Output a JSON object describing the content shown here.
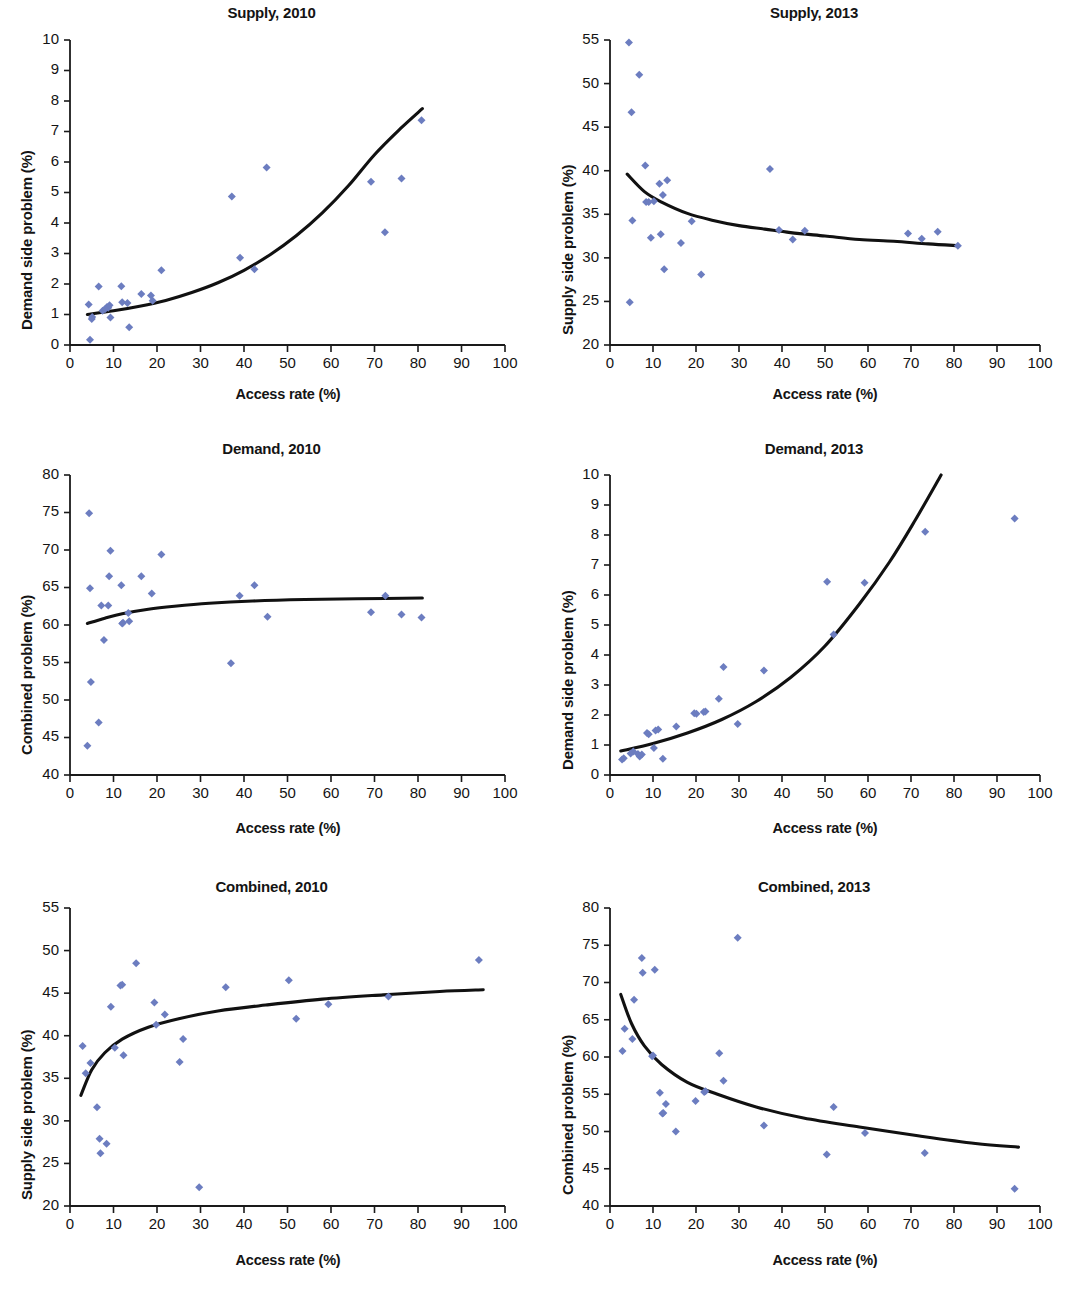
{
  "figure": {
    "panel_count": 6,
    "marker_color": "#6c7dc0",
    "curve_color": "#111111",
    "axis_color": "#1a1a1a"
  },
  "panels": [
    {
      "id": "supply-2010",
      "title": "Supply, 2010",
      "xlabel": "Access rate (%)",
      "ylabel": "Demand side problem (%)",
      "xlim": [
        0,
        100
      ],
      "ylim": [
        0,
        10
      ],
      "xticks": [
        0,
        10,
        20,
        30,
        40,
        50,
        60,
        70,
        80,
        90,
        100
      ],
      "yticks": [
        0,
        1,
        2,
        3,
        4,
        5,
        6,
        7,
        8,
        9,
        10
      ]
    },
    {
      "id": "supply-2013",
      "title": "Supply, 2013",
      "xlabel": "Access rate (%)",
      "ylabel": "Supply side problem (%)",
      "xlim": [
        0,
        100
      ],
      "ylim": [
        20,
        55
      ],
      "xticks": [
        0,
        10,
        20,
        30,
        40,
        50,
        60,
        70,
        80,
        90,
        100
      ],
      "yticks": [
        20,
        25,
        30,
        35,
        40,
        45,
        50,
        55
      ]
    },
    {
      "id": "demand-2010",
      "title": "Demand, 2010",
      "xlabel": "Access rate (%)",
      "ylabel": "Combined problem (%)",
      "xlim": [
        0,
        100
      ],
      "ylim": [
        40,
        80
      ],
      "xticks": [
        0,
        10,
        20,
        30,
        40,
        50,
        60,
        70,
        80,
        90,
        100
      ],
      "yticks": [
        40,
        45,
        50,
        55,
        60,
        65,
        70,
        75,
        80
      ]
    },
    {
      "id": "demand-2013",
      "title": "Demand, 2013",
      "xlabel": "Access rate (%)",
      "ylabel": "Demand side problem (%)",
      "xlim": [
        0,
        100
      ],
      "ylim": [
        0,
        10
      ],
      "xticks": [
        0,
        10,
        20,
        30,
        40,
        50,
        60,
        70,
        80,
        90,
        100
      ],
      "yticks": [
        0,
        1,
        2,
        3,
        4,
        5,
        6,
        7,
        8,
        9,
        10
      ]
    },
    {
      "id": "combined-2010",
      "title": "Combined, 2010",
      "xlabel": "Access rate (%)",
      "ylabel": "Supply side problem (%)",
      "xlim": [
        0,
        100
      ],
      "ylim": [
        20,
        55
      ],
      "xticks": [
        0,
        10,
        20,
        30,
        40,
        50,
        60,
        70,
        80,
        90,
        100
      ],
      "yticks": [
        20,
        25,
        30,
        35,
        40,
        45,
        50,
        55
      ]
    },
    {
      "id": "combined-2013",
      "title": "Combined, 2013",
      "xlabel": "Access rate (%)",
      "ylabel": "Combined problem (%)",
      "xlim": [
        0,
        100
      ],
      "ylim": [
        40,
        80
      ],
      "xticks": [
        0,
        10,
        20,
        30,
        40,
        50,
        60,
        70,
        80,
        90,
        100
      ],
      "yticks": [
        40,
        45,
        50,
        55,
        60,
        65,
        70,
        75,
        80
      ]
    }
  ],
  "chart_data": [
    {
      "type": "scatter",
      "title": "Supply, 2010",
      "xlabel": "Access rate (%)",
      "ylabel": "Demand side problem (%)",
      "xlim": [
        0,
        100
      ],
      "ylim": [
        0,
        10
      ],
      "grid": false,
      "legend": "none",
      "points": [
        [
          4.3,
          1.33
        ],
        [
          4.6,
          0.17
        ],
        [
          5.0,
          0.85
        ],
        [
          5.1,
          0.92
        ],
        [
          6.6,
          1.92
        ],
        [
          7.5,
          1.12
        ],
        [
          8.1,
          1.18
        ],
        [
          8.5,
          1.25
        ],
        [
          8.8,
          1.22
        ],
        [
          9.1,
          1.3
        ],
        [
          9.3,
          0.9
        ],
        [
          11.8,
          1.93
        ],
        [
          12.0,
          1.4
        ],
        [
          13.2,
          1.38
        ],
        [
          13.6,
          0.58
        ],
        [
          16.4,
          1.67
        ],
        [
          18.6,
          1.62
        ],
        [
          19.0,
          1.45
        ],
        [
          21.0,
          2.45
        ],
        [
          37.2,
          4.87
        ],
        [
          39.1,
          2.86
        ],
        [
          42.4,
          2.48
        ],
        [
          45.2,
          5.82
        ],
        [
          69.2,
          5.35
        ],
        [
          72.4,
          3.7
        ],
        [
          76.2,
          5.46
        ],
        [
          80.8,
          7.37
        ]
      ],
      "fit_curve": {
        "kind": "exponential",
        "x_range": [
          4.0,
          81.0
        ],
        "xy": [
          [
            4,
            1.0
          ],
          [
            10,
            1.12
          ],
          [
            16,
            1.27
          ],
          [
            22,
            1.46
          ],
          [
            28,
            1.72
          ],
          [
            34,
            2.04
          ],
          [
            40,
            2.45
          ],
          [
            46,
            2.96
          ],
          [
            52,
            3.58
          ],
          [
            58,
            4.33
          ],
          [
            64,
            5.22
          ],
          [
            70,
            6.24
          ],
          [
            76,
            7.1
          ],
          [
            81,
            7.75
          ]
        ]
      }
    },
    {
      "type": "scatter",
      "title": "Supply, 2013",
      "xlabel": "Access rate (%)",
      "ylabel": "Supply side problem (%)",
      "xlim": [
        0,
        100
      ],
      "ylim": [
        20,
        55
      ],
      "grid": false,
      "legend": "none",
      "points": [
        [
          4.4,
          54.7
        ],
        [
          4.6,
          24.9
        ],
        [
          5.0,
          46.7
        ],
        [
          5.2,
          34.3
        ],
        [
          6.8,
          51.0
        ],
        [
          8.2,
          40.6
        ],
        [
          8.4,
          36.4
        ],
        [
          9.0,
          36.4
        ],
        [
          9.5,
          32.3
        ],
        [
          10.2,
          36.5
        ],
        [
          11.5,
          38.5
        ],
        [
          11.8,
          32.7
        ],
        [
          12.3,
          37.2
        ],
        [
          12.6,
          28.7
        ],
        [
          13.3,
          38.9
        ],
        [
          16.5,
          31.7
        ],
        [
          19.0,
          34.2
        ],
        [
          21.2,
          28.1
        ],
        [
          37.2,
          40.2
        ],
        [
          39.3,
          33.2
        ],
        [
          42.5,
          32.1
        ],
        [
          45.3,
          33.1
        ],
        [
          69.3,
          32.8
        ],
        [
          72.5,
          32.2
        ],
        [
          76.2,
          33.0
        ],
        [
          80.9,
          31.4
        ]
      ],
      "fit_curve": {
        "kind": "power-decay",
        "x_range": [
          4.0,
          81.0
        ],
        "xy": [
          [
            4,
            39.6
          ],
          [
            8,
            37.6
          ],
          [
            12,
            36.4
          ],
          [
            18,
            35.1
          ],
          [
            24,
            34.3
          ],
          [
            30,
            33.7
          ],
          [
            36,
            33.3
          ],
          [
            42,
            32.9
          ],
          [
            50,
            32.5
          ],
          [
            58,
            32.1
          ],
          [
            66,
            31.9
          ],
          [
            74,
            31.6
          ],
          [
            81,
            31.4
          ]
        ]
      }
    },
    {
      "type": "scatter",
      "title": "Demand, 2010",
      "xlabel": "Access rate (%)",
      "ylabel": "Combined problem (%)",
      "xlim": [
        0,
        100
      ],
      "ylim": [
        40,
        80
      ],
      "grid": false,
      "legend": "none",
      "points": [
        [
          4.0,
          43.9
        ],
        [
          4.4,
          74.9
        ],
        [
          4.6,
          64.9
        ],
        [
          4.8,
          52.4
        ],
        [
          6.6,
          47.0
        ],
        [
          7.2,
          62.6
        ],
        [
          7.8,
          58.0
        ],
        [
          8.8,
          62.6
        ],
        [
          9.0,
          66.5
        ],
        [
          9.3,
          69.9
        ],
        [
          11.8,
          65.3
        ],
        [
          12.0,
          60.2
        ],
        [
          12.2,
          60.3
        ],
        [
          13.4,
          61.6
        ],
        [
          13.6,
          60.5
        ],
        [
          16.4,
          66.5
        ],
        [
          18.8,
          64.2
        ],
        [
          21.0,
          69.4
        ],
        [
          37.0,
          54.9
        ],
        [
          39.0,
          63.9
        ],
        [
          42.4,
          65.3
        ],
        [
          45.4,
          61.1
        ],
        [
          69.2,
          61.7
        ],
        [
          72.5,
          63.9
        ],
        [
          76.2,
          61.4
        ],
        [
          80.8,
          61.0
        ]
      ],
      "fit_curve": {
        "kind": "log-flat",
        "x_range": [
          4.0,
          81.0
        ],
        "xy": [
          [
            4,
            60.2
          ],
          [
            8,
            60.9
          ],
          [
            12,
            61.5
          ],
          [
            18,
            62.1
          ],
          [
            24,
            62.5
          ],
          [
            32,
            62.9
          ],
          [
            42,
            63.2
          ],
          [
            54,
            63.4
          ],
          [
            66,
            63.5
          ],
          [
            81,
            63.6
          ]
        ]
      }
    },
    {
      "type": "scatter",
      "title": "Demand, 2013",
      "xlabel": "Access rate (%)",
      "ylabel": "Demand side problem (%)",
      "xlim": [
        0,
        100
      ],
      "ylim": [
        0,
        10
      ],
      "grid": false,
      "legend": "none",
      "points": [
        [
          2.8,
          0.52
        ],
        [
          3.2,
          0.56
        ],
        [
          4.8,
          0.72
        ],
        [
          5.4,
          0.78
        ],
        [
          6.5,
          0.7
        ],
        [
          6.9,
          0.62
        ],
        [
          7.4,
          0.68
        ],
        [
          8.6,
          1.4
        ],
        [
          9.0,
          1.36
        ],
        [
          10.2,
          0.9
        ],
        [
          10.6,
          1.48
        ],
        [
          11.2,
          1.52
        ],
        [
          12.3,
          0.54
        ],
        [
          15.4,
          1.62
        ],
        [
          19.6,
          2.06
        ],
        [
          20.1,
          2.04
        ],
        [
          21.8,
          2.1
        ],
        [
          22.2,
          2.12
        ],
        [
          25.3,
          2.54
        ],
        [
          26.4,
          3.6
        ],
        [
          29.7,
          1.7
        ],
        [
          35.8,
          3.48
        ],
        [
          50.5,
          6.44
        ],
        [
          52.0,
          4.68
        ],
        [
          59.2,
          6.41
        ],
        [
          73.3,
          8.11
        ],
        [
          94.1,
          8.55
        ]
      ],
      "fit_curve": {
        "kind": "exponential",
        "x_range": [
          2.5,
          77.0
        ],
        "xy": [
          [
            2.5,
            0.8
          ],
          [
            10,
            1.05
          ],
          [
            18,
            1.4
          ],
          [
            26,
            1.85
          ],
          [
            34,
            2.45
          ],
          [
            42,
            3.25
          ],
          [
            50,
            4.3
          ],
          [
            58,
            5.7
          ],
          [
            65,
            7.1
          ],
          [
            71,
            8.5
          ],
          [
            77,
            10.0
          ]
        ]
      }
    },
    {
      "type": "scatter",
      "title": "Combined, 2010",
      "xlabel": "Access rate (%)",
      "ylabel": "Supply side problem (%)",
      "xlim": [
        0,
        100
      ],
      "ylim": [
        20,
        55
      ],
      "grid": false,
      "legend": "none",
      "points": [
        [
          2.9,
          38.8
        ],
        [
          3.6,
          35.6
        ],
        [
          4.7,
          36.8
        ],
        [
          6.2,
          31.6
        ],
        [
          6.8,
          27.9
        ],
        [
          7.0,
          26.2
        ],
        [
          8.4,
          27.3
        ],
        [
          9.4,
          43.4
        ],
        [
          10.3,
          38.6
        ],
        [
          11.6,
          45.9
        ],
        [
          12.0,
          46.0
        ],
        [
          12.3,
          37.7
        ],
        [
          15.2,
          48.5
        ],
        [
          19.4,
          43.9
        ],
        [
          19.8,
          41.3
        ],
        [
          21.8,
          42.5
        ],
        [
          25.2,
          36.9
        ],
        [
          26.0,
          39.6
        ],
        [
          29.7,
          22.2
        ],
        [
          35.8,
          45.7
        ],
        [
          50.3,
          46.5
        ],
        [
          52.0,
          42.0
        ],
        [
          59.4,
          43.7
        ],
        [
          73.2,
          44.6
        ],
        [
          94.0,
          48.9
        ]
      ],
      "fit_curve": {
        "kind": "log-rise",
        "x_range": [
          2.5,
          95.0
        ],
        "xy": [
          [
            2.5,
            33.0
          ],
          [
            5,
            36.0
          ],
          [
            8,
            38.0
          ],
          [
            12,
            39.6
          ],
          [
            18,
            41.0
          ],
          [
            25,
            42.0
          ],
          [
            34,
            42.9
          ],
          [
            45,
            43.6
          ],
          [
            58,
            44.3
          ],
          [
            72,
            44.8
          ],
          [
            85,
            45.2
          ],
          [
            95,
            45.4
          ]
        ]
      }
    },
    {
      "type": "scatter",
      "title": "Combined, 2013",
      "xlabel": "Access rate (%)",
      "ylabel": "Combined problem (%)",
      "xlim": [
        0,
        100
      ],
      "ylim": [
        40,
        80
      ],
      "grid": false,
      "legend": "none",
      "points": [
        [
          2.9,
          60.8
        ],
        [
          3.4,
          63.8
        ],
        [
          5.2,
          62.4
        ],
        [
          5.6,
          67.7
        ],
        [
          7.4,
          73.3
        ],
        [
          7.6,
          71.3
        ],
        [
          9.8,
          60.1
        ],
        [
          10.0,
          60.2
        ],
        [
          10.4,
          71.7
        ],
        [
          11.6,
          55.2
        ],
        [
          12.2,
          52.4
        ],
        [
          12.4,
          52.5
        ],
        [
          13.0,
          53.7
        ],
        [
          15.3,
          50.0
        ],
        [
          19.9,
          54.1
        ],
        [
          21.9,
          55.3
        ],
        [
          22.2,
          55.4
        ],
        [
          25.4,
          60.5
        ],
        [
          26.4,
          56.8
        ],
        [
          29.7,
          76.0
        ],
        [
          35.8,
          50.8
        ],
        [
          50.4,
          46.9
        ],
        [
          52.0,
          53.3
        ],
        [
          59.3,
          49.8
        ],
        [
          73.2,
          47.1
        ],
        [
          94.1,
          42.3
        ]
      ],
      "fit_curve": {
        "kind": "log-decay",
        "x_range": [
          2.5,
          95.0
        ],
        "xy": [
          [
            2.5,
            68.4
          ],
          [
            5,
            64.5
          ],
          [
            8,
            61.5
          ],
          [
            12,
            59.0
          ],
          [
            18,
            56.6
          ],
          [
            25,
            55.0
          ],
          [
            34,
            53.3
          ],
          [
            45,
            51.8
          ],
          [
            58,
            50.6
          ],
          [
            72,
            49.4
          ],
          [
            85,
            48.4
          ],
          [
            95,
            47.9
          ]
        ]
      }
    }
  ]
}
